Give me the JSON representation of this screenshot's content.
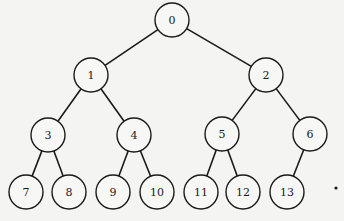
{
  "diagram": {
    "type": "binary-tree",
    "node_radius": 17,
    "colors": {
      "stroke": "#1a1a1a",
      "fill": "#f7f7f5",
      "background": "#f4f4f2"
    },
    "nodes": [
      {
        "id": "0",
        "label": "0",
        "x": 172,
        "y": 20
      },
      {
        "id": "1",
        "label": "1",
        "x": 91,
        "y": 75
      },
      {
        "id": "2",
        "label": "2",
        "x": 266,
        "y": 75
      },
      {
        "id": "3",
        "label": "3",
        "x": 48,
        "y": 135
      },
      {
        "id": "4",
        "label": "4",
        "x": 134,
        "y": 135
      },
      {
        "id": "5",
        "label": "5",
        "x": 222,
        "y": 134
      },
      {
        "id": "6",
        "label": "6",
        "x": 310,
        "y": 134
      },
      {
        "id": "7",
        "label": "7",
        "x": 26,
        "y": 192
      },
      {
        "id": "8",
        "label": "8",
        "x": 69,
        "y": 192
      },
      {
        "id": "9",
        "label": "9",
        "x": 113,
        "y": 192
      },
      {
        "id": "10",
        "label": "10",
        "x": 157,
        "y": 192
      },
      {
        "id": "11",
        "label": "11",
        "x": 201,
        "y": 192
      },
      {
        "id": "12",
        "label": "12",
        "x": 243,
        "y": 192
      },
      {
        "id": "13",
        "label": "13",
        "x": 287,
        "y": 192
      }
    ],
    "edges": [
      [
        "0",
        "1"
      ],
      [
        "0",
        "2"
      ],
      [
        "1",
        "3"
      ],
      [
        "1",
        "4"
      ],
      [
        "2",
        "5"
      ],
      [
        "2",
        "6"
      ],
      [
        "3",
        "7"
      ],
      [
        "3",
        "8"
      ],
      [
        "4",
        "9"
      ],
      [
        "4",
        "10"
      ],
      [
        "5",
        "11"
      ],
      [
        "5",
        "12"
      ],
      [
        "6",
        "13"
      ]
    ]
  }
}
